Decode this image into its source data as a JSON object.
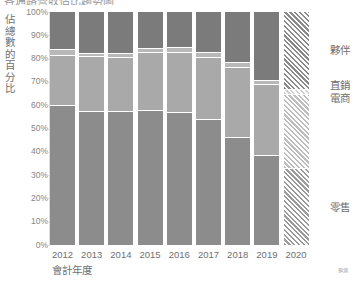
{
  "title": {
    "text": "各通路營收佔比趨勢圖",
    "cut_off": true
  },
  "axes": {
    "y_label": "佔總數的百分比",
    "y_ticks": [
      "100%",
      "90%",
      "80%",
      "70%",
      "60%",
      "50%",
      "40%",
      "30%",
      "20%",
      "10%",
      "0%"
    ],
    "x_label": "會計年度",
    "x_ticks": [
      "2012",
      "2013",
      "2014",
      "2015",
      "2016",
      "2017",
      "2018",
      "2019",
      "2020"
    ]
  },
  "legend": {
    "items": [
      {
        "label": "夥伴",
        "color": "#7b7b7b"
      },
      {
        "label": "直銷",
        "color": "#b8b8b8"
      },
      {
        "label": "電商",
        "color": "#a9a9a9"
      },
      {
        "label": "零售",
        "color": "#8c8c8c"
      }
    ]
  },
  "notes": {
    "forecast": "預測"
  },
  "colors": {
    "retail": "#8c8c8c",
    "ecommerce": "#a9a9a9",
    "direct": "#b8b8b8",
    "partner": "#7b7b7b",
    "axis": "#dcdcdc",
    "text": "#6f6f6f"
  },
  "chart_data": {
    "type": "bar",
    "stacked": true,
    "normalized_percent": true,
    "title": "各通路營收佔比趨勢圖",
    "xlabel": "會計年度",
    "ylabel": "佔總數的百分比",
    "ylim": [
      0,
      100
    ],
    "grid": false,
    "legend_position": "right",
    "categories": [
      "2012",
      "2013",
      "2014",
      "2015",
      "2016",
      "2017",
      "2018",
      "2019",
      "2020"
    ],
    "forecast_categories": [
      "2020"
    ],
    "annotations": [
      "預測"
    ],
    "series": [
      {
        "name": "零售",
        "color": "#8c8c8c",
        "values": [
          60,
          57.5,
          57.5,
          58,
          57,
          54,
          46.5,
          38.5,
          33
        ]
      },
      {
        "name": "電商",
        "color": "#a9a9a9",
        "values": [
          21.5,
          23.5,
          23,
          25,
          26,
          26.5,
          30,
          30.5,
          32
        ]
      },
      {
        "name": "直銷",
        "color": "#b8b8b8",
        "values": [
          2.5,
          1.5,
          2,
          1.5,
          2,
          2.5,
          2,
          2,
          2
        ]
      },
      {
        "name": "夥伴",
        "color": "#7b7b7b",
        "values": [
          16,
          17.5,
          17.5,
          15.5,
          15,
          17,
          21.5,
          29,
          33
        ]
      }
    ]
  }
}
